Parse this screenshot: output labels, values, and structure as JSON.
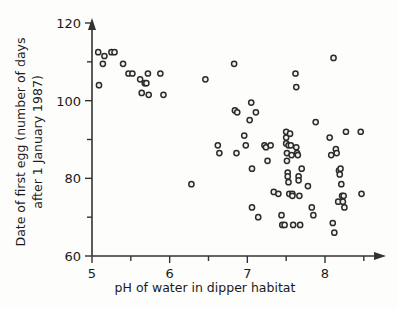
{
  "chart_data": {
    "type": "scatter",
    "title": "",
    "xlabel": "pH of water in dipper habitat",
    "ylabel": "Date of first egg (number of days after 1 January 1987)",
    "ylabel_line1": "Date of first egg (number of days",
    "ylabel_line2": "after 1 January 1987)",
    "xlim": [
      5.0,
      8.6
    ],
    "ylim": [
      60,
      120
    ],
    "xticks": [
      5,
      6,
      7,
      8
    ],
    "xtick_labels": [
      "5",
      "6",
      "7",
      "8"
    ],
    "xticks_minor": [
      5.5,
      6.5,
      7.5,
      8.5
    ],
    "yticks": [
      60,
      80,
      100,
      120
    ],
    "ytick_labels": [
      "60",
      "80",
      "100",
      "120"
    ],
    "yticks_minor": [
      70,
      90,
      110
    ],
    "grid": false,
    "legend": "none",
    "marker": "open-circle",
    "marker_color": "#2b2b2b",
    "marker_fill": "#f2f2f0",
    "n_points": 90,
    "points": [
      [
        5.08,
        112.5
      ],
      [
        5.09,
        104.0
      ],
      [
        5.14,
        109.5
      ],
      [
        5.16,
        111.5
      ],
      [
        5.25,
        112.5
      ],
      [
        5.29,
        112.5
      ],
      [
        5.4,
        109.5
      ],
      [
        5.47,
        107.0
      ],
      [
        5.52,
        107.0
      ],
      [
        5.62,
        105.5
      ],
      [
        5.64,
        102.0
      ],
      [
        5.68,
        104.5
      ],
      [
        5.7,
        104.5
      ],
      [
        5.72,
        107.0
      ],
      [
        5.73,
        101.5
      ],
      [
        5.88,
        107.0
      ],
      [
        5.92,
        101.5
      ],
      [
        6.28,
        78.5
      ],
      [
        6.46,
        105.5
      ],
      [
        6.62,
        88.5
      ],
      [
        6.64,
        86.5
      ],
      [
        6.83,
        109.5
      ],
      [
        6.84,
        97.5
      ],
      [
        6.86,
        86.5
      ],
      [
        6.87,
        97.0
      ],
      [
        6.96,
        91.0
      ],
      [
        6.98,
        88.5
      ],
      [
        7.03,
        95.0
      ],
      [
        7.05,
        99.5
      ],
      [
        7.06,
        82.5
      ],
      [
        7.06,
        72.5
      ],
      [
        7.11,
        97.0
      ],
      [
        7.14,
        70.0
      ],
      [
        7.22,
        88.5
      ],
      [
        7.24,
        88.0
      ],
      [
        7.26,
        84.5
      ],
      [
        7.3,
        88.5
      ],
      [
        7.34,
        76.5
      ],
      [
        7.4,
        76.0
      ],
      [
        7.44,
        70.5
      ],
      [
        7.45,
        68.0
      ],
      [
        7.48,
        68.0
      ],
      [
        7.5,
        92.0
      ],
      [
        7.5,
        90.5
      ],
      [
        7.5,
        89.0
      ],
      [
        7.51,
        86.5
      ],
      [
        7.51,
        84.5
      ],
      [
        7.52,
        81.5
      ],
      [
        7.52,
        80.5
      ],
      [
        7.53,
        88.5
      ],
      [
        7.53,
        79.0
      ],
      [
        7.54,
        76.0
      ],
      [
        7.55,
        91.5
      ],
      [
        7.56,
        88.5
      ],
      [
        7.57,
        86.0
      ],
      [
        7.58,
        76.0
      ],
      [
        7.58,
        75.5
      ],
      [
        7.59,
        68.0
      ],
      [
        7.62,
        107.0
      ],
      [
        7.63,
        103.5
      ],
      [
        7.63,
        88.0
      ],
      [
        7.64,
        86.5
      ],
      [
        7.65,
        86.0
      ],
      [
        7.66,
        80.5
      ],
      [
        7.66,
        79.5
      ],
      [
        7.67,
        75.5
      ],
      [
        7.68,
        68.0
      ],
      [
        7.7,
        82.5
      ],
      [
        7.78,
        78.0
      ],
      [
        7.83,
        72.5
      ],
      [
        7.85,
        70.5
      ],
      [
        7.88,
        94.5
      ],
      [
        8.06,
        90.5
      ],
      [
        8.08,
        86.0
      ],
      [
        8.1,
        68.5
      ],
      [
        8.11,
        111.0
      ],
      [
        8.12,
        66.0
      ],
      [
        8.14,
        87.5
      ],
      [
        8.15,
        86.5
      ],
      [
        8.17,
        74.0
      ],
      [
        8.18,
        82.0
      ],
      [
        8.19,
        81.0
      ],
      [
        8.2,
        82.5
      ],
      [
        8.21,
        78.5
      ],
      [
        8.22,
        75.5
      ],
      [
        8.23,
        74.0
      ],
      [
        8.24,
        75.5
      ],
      [
        8.25,
        72.5
      ],
      [
        8.27,
        92.0
      ],
      [
        8.46,
        92.0
      ],
      [
        8.47,
        76.0
      ]
    ]
  }
}
